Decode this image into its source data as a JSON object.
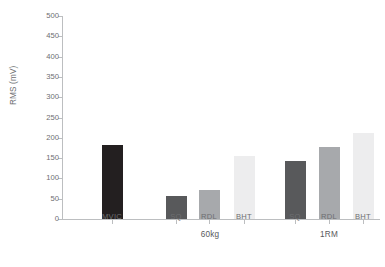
{
  "chart_data": {
    "type": "bar",
    "title": "",
    "xlabel": "",
    "ylabel": "RMS (mV)",
    "ylim": [
      0,
      500
    ],
    "yticks": [
      0,
      50,
      100,
      150,
      200,
      250,
      300,
      350,
      400,
      450,
      500
    ],
    "grid": false,
    "legend": false,
    "categories": [
      "MVIC",
      "SQ",
      "RDL",
      "BHT",
      "SQ",
      "RDL",
      "BHT"
    ],
    "values": [
      182,
      57,
      71,
      155,
      143,
      177,
      213
    ],
    "groups": [
      {
        "label": "",
        "categories": [
          "MVIC"
        ]
      },
      {
        "label": "60kg",
        "categories": [
          "SQ",
          "RDL",
          "BHT"
        ]
      },
      {
        "label": "1RM",
        "categories": [
          "SQ",
          "RDL",
          "BHT"
        ]
      }
    ],
    "bars": [
      {
        "label": "MVIC",
        "group": "",
        "value": 182,
        "color": "#231f20"
      },
      {
        "label": "SQ",
        "group": "60kg",
        "value": 57,
        "color": "#58595b"
      },
      {
        "label": "RDL",
        "group": "60kg",
        "value": 71,
        "color": "#a7a9ac"
      },
      {
        "label": "BHT",
        "group": "60kg",
        "value": 155,
        "color": "#ededee"
      },
      {
        "label": "SQ",
        "group": "1RM",
        "value": 143,
        "color": "#58595b"
      },
      {
        "label": "RDL",
        "group": "1RM",
        "value": 177,
        "color": "#a7a9ac"
      },
      {
        "label": "BHT",
        "group": "1RM",
        "value": 213,
        "color": "#ededee"
      }
    ],
    "colors": {
      "mvic": "#231f20",
      "sq": "#58595b",
      "rdl": "#a7a9ac",
      "bht": "#ededee",
      "axis": "#bcbec0",
      "tick_text": "#6d6e71",
      "background": "#ffffff"
    }
  }
}
